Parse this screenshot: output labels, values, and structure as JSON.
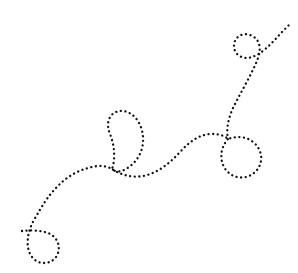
{
  "canvas": {
    "width": 298,
    "height": 273,
    "background_color": "#ffffff",
    "title": "dotted-looping-path-doodle"
  },
  "artwork": {
    "name": "dotted-curly-path",
    "description": "A hand-drawn style dotted line that meanders from the lower-left to the upper-right, forming four loops along its length.",
    "stroke_color": "#111111",
    "stroke_width": 2.3,
    "dash_pattern": "0.1 4.5",
    "dash_style": "dotted",
    "line_cap": "round",
    "fill": "none",
    "loop_count": 4,
    "path_d": "M 22 231 C 30 230 40 230 48 233 C 58 237 62 248 56 257 C 50 265 38 265 32 257 C 25 248 27 232 34 220 C 42 206 48 196 56 188 C 66 177 78 170 92 167 C 100 165 107 166 112 169 C 116 158 114 144 110 134 C 105 122 110 112 120 111 C 132 110 142 122 143 137 C 144 152 136 164 124 170 C 118 173 114 171 112 169 C 121 175 132 178 143 176 C 158 173 170 163 180 152 C 190 141 200 134 212 134 C 220 134 225 136 228 139 C 236 136 246 136 253 142 C 262 149 264 161 257 170 C 249 180 234 180 226 170 C 219 161 220 148 228 139 C 226 130 228 118 234 106 C 242 90 252 74 258 58 C 262 47 259 38 250 35 C 241 32 234 38 234 46 C 234 55 243 60 252 57 C 262 54 272 43 282 32 C 285 29 288 26 291 23",
    "segments": [
      {
        "name": "left-tail",
        "from": [
          22,
          231
        ],
        "to": [
          48,
          233
        ]
      },
      {
        "name": "loop-bottom-left",
        "center": [
          44,
          245
        ],
        "radius": 13
      },
      {
        "name": "rising-curve",
        "from": [
          34,
          220
        ],
        "to": [
          112,
          169
        ]
      },
      {
        "name": "loop-middle-teardrop",
        "center": [
          122,
          140
        ],
        "rx": 21,
        "ry": 29
      },
      {
        "name": "valley-curve",
        "from": [
          112,
          169
        ],
        "to": [
          212,
          134
        ]
      },
      {
        "name": "loop-right-round",
        "center": [
          240,
          156
        ],
        "radius": 22
      },
      {
        "name": "ascending-curve",
        "from": [
          228,
          139
        ],
        "to": [
          250,
          35
        ]
      },
      {
        "name": "loop-top-right",
        "center": [
          243,
          46
        ],
        "radius": 12
      },
      {
        "name": "upper-right-tail",
        "from": [
          252,
          57
        ],
        "to": [
          291,
          23
        ]
      }
    ]
  }
}
